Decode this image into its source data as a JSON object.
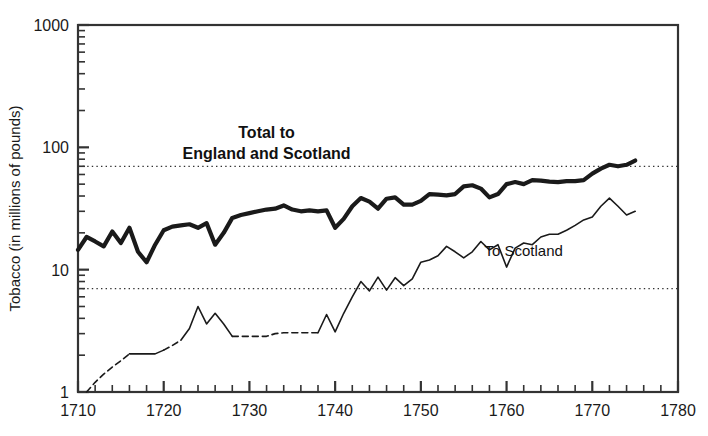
{
  "chart_data": {
    "type": "line",
    "title": "",
    "xlabel": "",
    "ylabel": "Tobacco (in millions of pounds)",
    "xlim": [
      1710,
      1780
    ],
    "ylim": [
      1,
      1000
    ],
    "yscale": "log",
    "grid": false,
    "legend_position": "inline-annotations",
    "x_ticks": [
      1710,
      1720,
      1730,
      1740,
      1750,
      1760,
      1770,
      1780
    ],
    "x_tick_labels": [
      "1710",
      "1720",
      "1730",
      "1740",
      "1750",
      "1760",
      "1770",
      "1780"
    ],
    "y_ticks": [
      1,
      10,
      100,
      1000
    ],
    "y_tick_labels": [
      "1",
      "10",
      "100",
      "1000"
    ],
    "reference_lines": [
      {
        "name": "upper-reference-line",
        "value": 70,
        "style": "dotted"
      },
      {
        "name": "lower-reference-line",
        "value": 7,
        "style": "dotted"
      }
    ],
    "annotations": [
      {
        "name": "total-series-label",
        "text_line1": "Total to",
        "text_line2": "England and Scotland",
        "x": 1732,
        "y": 120,
        "weight": "bold"
      },
      {
        "name": "scotland-series-label",
        "text": "To Scotland",
        "x": 1762,
        "y": 13,
        "weight": "normal"
      }
    ],
    "series": [
      {
        "name": "Total to England and Scotland",
        "style": "solid",
        "width": "thick",
        "color": "#1a1a1a",
        "x": [
          1710,
          1711,
          1712,
          1713,
          1714,
          1715,
          1716,
          1717,
          1718,
          1719,
          1720,
          1721,
          1722,
          1723,
          1724,
          1725,
          1726,
          1727,
          1728,
          1729,
          1730,
          1731,
          1732,
          1733,
          1734,
          1735,
          1736,
          1737,
          1738,
          1739,
          1740,
          1741,
          1742,
          1743,
          1744,
          1745,
          1746,
          1747,
          1748,
          1749,
          1750,
          1751,
          1752,
          1753,
          1754,
          1755,
          1756,
          1757,
          1758,
          1759,
          1760,
          1761,
          1762,
          1763,
          1764,
          1765,
          1766,
          1767,
          1768,
          1769,
          1770,
          1771,
          1772,
          1773,
          1774,
          1775
        ],
        "values": [
          14.5,
          18.5,
          17.0,
          15.5,
          20.5,
          16.5,
          22.0,
          14.0,
          11.5,
          16.0,
          21.0,
          22.5,
          23.0,
          23.5,
          22.0,
          24.0,
          16.0,
          20.0,
          26.5,
          28.0,
          29.0,
          30.0,
          31.0,
          31.5,
          33.5,
          31.0,
          30.0,
          30.5,
          30.0,
          30.5,
          22.0,
          26.0,
          33.0,
          38.5,
          36.0,
          31.5,
          38.0,
          39.0,
          34.0,
          34.0,
          36.5,
          41.5,
          41.0,
          40.5,
          41.5,
          48.0,
          49.0,
          46.0,
          39.0,
          41.5,
          50.0,
          52.0,
          50.0,
          54.0,
          53.5,
          52.5,
          52.0,
          53.0,
          53.0,
          54.0,
          61.0,
          67.0,
          72.0,
          70.0,
          72.0,
          78.0
        ]
      },
      {
        "name": "To Scotland",
        "style": "dashed-then-solid",
        "width": "thin",
        "color": "#1a1a1a",
        "x": [
          1711,
          1712,
          1713,
          1714,
          1715,
          1716,
          1717,
          1718,
          1719,
          1720,
          1721,
          1722,
          1723,
          1724,
          1725,
          1726,
          1727,
          1728,
          1729,
          1730,
          1731,
          1732,
          1733,
          1734,
          1735,
          1736,
          1737,
          1738,
          1739,
          1740,
          1741,
          1742,
          1743,
          1744,
          1745,
          1746,
          1747,
          1748,
          1749,
          1750,
          1751,
          1752,
          1753,
          1754,
          1755,
          1756,
          1757,
          1758,
          1759,
          1760,
          1761,
          1762,
          1763,
          1764,
          1765,
          1766,
          1767,
          1768,
          1769,
          1770,
          1771,
          1772,
          1773,
          1774,
          1775
        ],
        "values": [
          1.0,
          1.2,
          1.4,
          1.6,
          1.8,
          2.05,
          2.05,
          2.05,
          2.05,
          2.2,
          2.4,
          2.65,
          3.3,
          5.0,
          3.6,
          4.4,
          3.6,
          2.85,
          2.85,
          2.85,
          2.85,
          2.85,
          3.0,
          3.05,
          3.05,
          3.05,
          3.05,
          3.05,
          4.3,
          3.1,
          4.4,
          6.0,
          8.0,
          6.7,
          8.7,
          6.8,
          8.6,
          7.4,
          8.4,
          11.5,
          12.0,
          13.0,
          15.5,
          14.0,
          12.5,
          14.0,
          17.0,
          14.5,
          16.0,
          10.5,
          15.0,
          16.5,
          16.0,
          18.5,
          19.5,
          19.5,
          21.0,
          23.0,
          25.5,
          27.0,
          33.0,
          38.5,
          33.0,
          28.0,
          30.0
        ],
        "dashed_segments": [
          [
            1711,
            1716
          ],
          [
            1720,
            1722
          ],
          [
            1728,
            1738
          ]
        ]
      }
    ]
  },
  "axis": {
    "y_label": "Tobacco (in millions of pounds)"
  }
}
